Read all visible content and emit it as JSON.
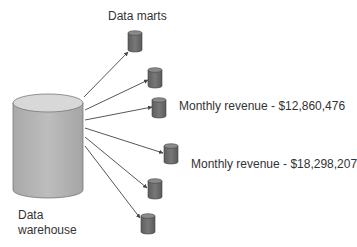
{
  "diagram": {
    "marts_label": "Data marts",
    "warehouse_label_line1": "Data",
    "warehouse_label_line2": "warehouse",
    "annotations": [
      {
        "text": "Monthly revenue - $12,860,476",
        "target_mart": 3
      },
      {
        "text": "Monthly revenue - $18,298,207",
        "target_mart": 4
      }
    ],
    "nodes": [
      {
        "id": "warehouse",
        "type": "large-cylinder"
      },
      {
        "id": "mart-1",
        "type": "small-cylinder"
      },
      {
        "id": "mart-2",
        "type": "small-cylinder"
      },
      {
        "id": "mart-3",
        "type": "small-cylinder"
      },
      {
        "id": "mart-4",
        "type": "small-cylinder"
      },
      {
        "id": "mart-5",
        "type": "small-cylinder"
      },
      {
        "id": "mart-6",
        "type": "small-cylinder"
      }
    ],
    "edges": [
      {
        "from": "warehouse",
        "to": "mart-1"
      },
      {
        "from": "warehouse",
        "to": "mart-2"
      },
      {
        "from": "warehouse",
        "to": "mart-3"
      },
      {
        "from": "warehouse",
        "to": "mart-4"
      },
      {
        "from": "warehouse",
        "to": "mart-5"
      },
      {
        "from": "warehouse",
        "to": "mart-6"
      }
    ],
    "colors": {
      "warehouse_body": "#b5b5b5",
      "warehouse_top": "#d6d6d6",
      "mart_body": "#6e6e6e",
      "mart_top": "#8c8c8c",
      "arrow": "#444444"
    }
  }
}
